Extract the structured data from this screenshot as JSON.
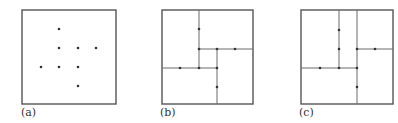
{
  "figure": {
    "colors": {
      "frame": "#555555",
      "line": "#6a6a6a",
      "point": "#333333",
      "background": "#ffffff"
    },
    "panels": [
      {
        "id": "a",
        "label": "(a)",
        "description": "Point set in a square region",
        "frame": [
          22,
          10,
          116,
          104
        ],
        "points": [
          [
            59,
            29
          ],
          [
            59,
            48
          ],
          [
            78,
            48
          ],
          [
            96,
            48
          ],
          [
            41,
            67
          ],
          [
            59,
            67
          ],
          [
            78,
            67
          ],
          [
            78,
            86
          ]
        ],
        "segments": []
      },
      {
        "id": "b",
        "label": "(b)",
        "description": "Rectangular subdivision of the square through the points",
        "frame": [
          162,
          10,
          253,
          104
        ],
        "points": [
          [
            199,
            29
          ],
          [
            199,
            49
          ],
          [
            217,
            49
          ],
          [
            235,
            49
          ],
          [
            180,
            68
          ],
          [
            199,
            68
          ],
          [
            217,
            68
          ],
          [
            217,
            87
          ]
        ],
        "segments": [
          [
            199,
            10,
            199,
            68
          ],
          [
            199,
            49,
            253,
            49
          ],
          [
            217,
            49,
            217,
            104
          ],
          [
            162,
            68,
            217,
            68
          ]
        ]
      },
      {
        "id": "c",
        "label": "(c)",
        "description": "Alternative rectangular subdivision of the square through the points",
        "frame": [
          301,
          10,
          393,
          104
        ],
        "points": [
          [
            339,
            30
          ],
          [
            339,
            49
          ],
          [
            357,
            49
          ],
          [
            375,
            49
          ],
          [
            320,
            68
          ],
          [
            339,
            68
          ],
          [
            357,
            68
          ],
          [
            357,
            87
          ]
        ],
        "segments": [
          [
            339,
            10,
            339,
            68
          ],
          [
            357,
            10,
            357,
            104
          ],
          [
            357,
            49,
            393,
            49
          ],
          [
            301,
            68,
            357,
            68
          ]
        ]
      }
    ]
  }
}
